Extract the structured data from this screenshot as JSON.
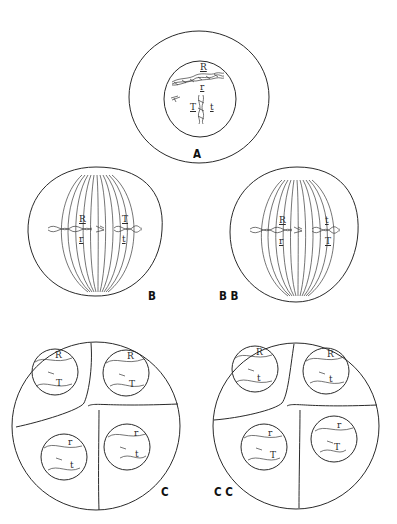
{
  "figure": {
    "panels": [
      {
        "id": "A",
        "label": "A",
        "stage": "prophase/metaphase cell with paired chromosomes",
        "genes": [
          "R",
          "r",
          "T",
          "t"
        ]
      },
      {
        "id": "B",
        "label": "B",
        "stage": "metaphase I spindle",
        "genes_left": {
          "top": "R",
          "bottom": "r"
        },
        "genes_right": {
          "top": "T",
          "bottom": "t"
        }
      },
      {
        "id": "BB",
        "label": "B B",
        "stage": "metaphase I spindle (alternate orientation)",
        "genes_left": {
          "top": "R",
          "bottom": "r"
        },
        "genes_right": {
          "top": "t",
          "bottom": "T"
        }
      },
      {
        "id": "C",
        "label": "C",
        "stage": "tetrad of four cells",
        "cells": [
          {
            "top": "R",
            "bottom": "T"
          },
          {
            "top": "R",
            "bottom": "T"
          },
          {
            "top": "r",
            "bottom": "t"
          },
          {
            "top": "r",
            "bottom": "t"
          }
        ]
      },
      {
        "id": "CC",
        "label": "C C",
        "stage": "tetrad of four cells (alternate)",
        "cells": [
          {
            "top": "R",
            "bottom": "t"
          },
          {
            "top": "R",
            "bottom": "t"
          },
          {
            "top": "r",
            "bottom": "T"
          },
          {
            "top": "r",
            "bottom": "T"
          }
        ]
      }
    ]
  }
}
